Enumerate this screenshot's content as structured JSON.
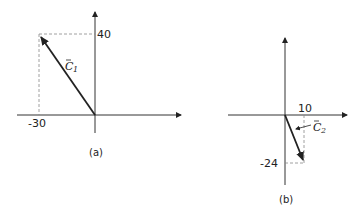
{
  "figure": {
    "panels": [
      {
        "id": "a",
        "caption": "(a)",
        "vector": {
          "name": "C",
          "subscript": "1",
          "x": -30,
          "y": 40
        },
        "x_tick_label": "-30",
        "y_tick_label": "40"
      },
      {
        "id": "b",
        "caption": "(b)",
        "vector": {
          "name": "C",
          "subscript": "2",
          "x": 10,
          "y": -24
        },
        "x_tick_label": "10",
        "y_tick_label": "-24"
      }
    ],
    "colors": {
      "line": "#222222",
      "dashed": "#888888",
      "background": "#ffffff"
    }
  }
}
